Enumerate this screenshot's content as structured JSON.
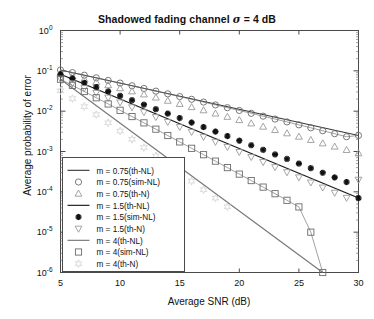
{
  "chart_data": {
    "type": "line",
    "title": "Shadowed fading channel σ = 4 dB",
    "title_prefix": "Shadowed fading channel ",
    "title_sigma": "σ",
    "title_suffix": " = 4 dB",
    "xlabel": "Average SNR (dB)",
    "ylabel": "Average probability of error",
    "xlim": [
      5,
      30
    ],
    "ylim": [
      1e-06,
      1
    ],
    "yscale": "log",
    "xticks": [
      5,
      10,
      15,
      20,
      25,
      30
    ],
    "xticklabels": [
      "5",
      "10",
      "15",
      "20",
      "25",
      "30"
    ],
    "yticks": [
      1,
      0.1,
      0.01,
      0.001,
      0.0001,
      1e-05,
      1e-06
    ],
    "yticklabels": [
      "10",
      "10",
      "10",
      "10",
      "10",
      "10",
      "10"
    ],
    "yticexponents": [
      "0",
      "-1",
      "-2",
      "-3",
      "-4",
      "-5",
      "-6"
    ],
    "grid": false,
    "legend_position": "lower-left",
    "marker_x": [
      5,
      6,
      7,
      8,
      9,
      10,
      11,
      12,
      13,
      14,
      15,
      16,
      17,
      18,
      19,
      20,
      21,
      22,
      23,
      24,
      25,
      26,
      27,
      28,
      29,
      30
    ],
    "series": [
      {
        "name": "m = 0.75(th-NL)",
        "marker": "none",
        "linestyle": "solid",
        "color": "#3a3a3a",
        "x": [
          5,
          30
        ],
        "values": [
          0.105,
          0.0025
        ]
      },
      {
        "name": "m = 0.75(sim-NL)",
        "marker": "circle",
        "linestyle": "none",
        "color": "#6b6b6b",
        "x": [
          5,
          6,
          7,
          8,
          9,
          10,
          11,
          12,
          13,
          14,
          15,
          16,
          17,
          18,
          19,
          20,
          21,
          22,
          23,
          24,
          25,
          26,
          27,
          28,
          29,
          30
        ],
        "values": [
          0.105,
          0.0905,
          0.078,
          0.0672,
          0.0578,
          0.0497,
          0.0427,
          0.0366,
          0.0314,
          0.0269,
          0.023,
          0.0197,
          0.0168,
          0.0143,
          0.0122,
          0.0104,
          0.00885,
          0.00752,
          0.00638,
          0.00541,
          0.00458,
          0.00387,
          0.00327,
          0.00276,
          0.00232,
          0.0025
        ]
      },
      {
        "name": "m = 0.75(th-N)",
        "marker": "triangle-up",
        "linestyle": "none",
        "color": "#9a9a9a",
        "x": [
          5,
          6,
          7,
          8,
          9,
          10,
          11,
          12,
          13,
          14,
          15,
          16,
          17,
          18,
          19,
          20,
          21,
          22,
          23,
          24,
          25,
          26,
          27,
          28,
          29,
          30
        ],
        "values": [
          0.087,
          0.0735,
          0.062,
          0.0523,
          0.044,
          0.037,
          0.031,
          0.026,
          0.0217,
          0.0181,
          0.0151,
          0.0126,
          0.0105,
          0.0087,
          0.00723,
          0.006,
          0.00497,
          0.00412,
          0.00341,
          0.00282,
          0.00233,
          0.00193,
          0.00159,
          0.00132,
          0.00109,
          0.0009
        ]
      },
      {
        "name": "m = 1.5(th-NL)",
        "marker": "none",
        "linestyle": "solid",
        "color": "#1a1a1a",
        "x": [
          5,
          30
        ],
        "values": [
          0.082,
          7e-05
        ]
      },
      {
        "name": "m = 1.5(sim-NL)",
        "marker": "asterisk",
        "linestyle": "none",
        "color": "#111111",
        "x": [
          5,
          6,
          7,
          8,
          9,
          10,
          11,
          12,
          13,
          14,
          15,
          16,
          17,
          18,
          19,
          20,
          21,
          22,
          23,
          24,
          25,
          26,
          27,
          28,
          29,
          30
        ],
        "values": [
          0.082,
          0.0645,
          0.0505,
          0.0395,
          0.0308,
          0.024,
          0.0187,
          0.0145,
          0.0112,
          0.00872,
          0.00676,
          0.00523,
          0.00404,
          0.00312,
          0.00241,
          0.00186,
          0.00143,
          0.0011,
          0.000848,
          0.000653,
          0.000502,
          0.000386,
          0.000297,
          0.000228,
          0.000175,
          7e-05
        ]
      },
      {
        "name": "m = 1.5(th-N)",
        "marker": "triangle-down",
        "linestyle": "none",
        "color": "#9a9a9a",
        "x": [
          5,
          6,
          7,
          8,
          9,
          10,
          11,
          12,
          13,
          14,
          15,
          16,
          17,
          18,
          19,
          20,
          21,
          22,
          23,
          24,
          25,
          26,
          27,
          28,
          29,
          30
        ],
        "values": [
          0.064,
          0.049,
          0.0374,
          0.0285,
          0.0217,
          0.0165,
          0.0125,
          0.00947,
          0.00716,
          0.00541,
          0.00408,
          0.00307,
          0.00231,
          0.00174,
          0.0013,
          0.000977,
          0.000732,
          0.000548,
          0.00041,
          0.000307,
          0.000229,
          0.000171,
          0.000128,
          9.52e-05,
          7.1e-05,
          0.0002
        ]
      },
      {
        "name": "m = 4(th-NL)",
        "marker": "none",
        "linestyle": "solid",
        "color": "#777777",
        "x": [
          5,
          27
        ],
        "values": [
          0.062,
          1e-06
        ]
      },
      {
        "name": "m = 4(sim-NL)",
        "marker": "square",
        "linestyle": "none",
        "color": "#6b6b6b",
        "x": [
          5,
          6,
          7,
          8,
          9,
          10,
          11,
          12,
          13,
          14,
          15,
          16,
          17,
          18,
          19,
          20,
          21,
          22,
          23,
          24,
          25,
          26,
          27
        ],
        "values": [
          0.062,
          0.0437,
          0.0307,
          0.0215,
          0.0151,
          0.0105,
          0.00735,
          0.00513,
          0.00358,
          0.00249,
          0.00173,
          0.0012,
          0.000833,
          0.000577,
          0.000399,
          0.000275,
          0.00019,
          0.000131,
          8.99e-05,
          6.17e-05,
          4.23e-05,
          1e-05,
          1e-06
        ]
      },
      {
        "name": "m = 4(th-N)",
        "marker": "star",
        "linestyle": "none",
        "color": "#d0d0d0",
        "x": [
          5,
          6,
          7,
          8,
          9,
          10,
          11,
          12,
          13,
          14,
          15,
          16,
          17,
          18,
          19
        ],
        "values": [
          0.032,
          0.0205,
          0.013,
          0.0082,
          0.00515,
          0.00322,
          0.00201,
          0.00125,
          0.000777,
          0.000482,
          0.000298,
          0.000184,
          0.000113,
          6.98e-05,
          4.28e-05
        ]
      }
    ],
    "legend_entries": [
      {
        "label": "m = 0.75(th-NL)",
        "marker": "line",
        "color": "#3a3a3a"
      },
      {
        "label": "m = 0.75(sim-NL)",
        "marker": "circle",
        "color": "#6b6b6b"
      },
      {
        "label": "m = 0.75(th-N)",
        "marker": "triangle-up",
        "color": "#9a9a9a"
      },
      {
        "label": "m = 1.5(th-NL)",
        "marker": "line",
        "color": "#1a1a1a"
      },
      {
        "label": "m = 1.5(sim-NL)",
        "marker": "asterisk",
        "color": "#111111"
      },
      {
        "label": "m = 1.5(th-N)",
        "marker": "triangle-down",
        "color": "#9a9a9a"
      },
      {
        "label": "m = 4(th-NL)",
        "marker": "line",
        "color": "#777777"
      },
      {
        "label": "m = 4(sim-NL)",
        "marker": "square",
        "color": "#6b6b6b"
      },
      {
        "label": "m = 4(th-N)",
        "marker": "star",
        "color": "#d0d0d0"
      }
    ]
  }
}
